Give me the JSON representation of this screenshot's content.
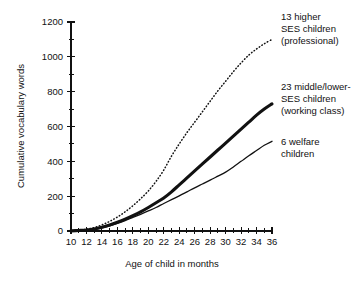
{
  "chart_data": {
    "type": "line",
    "title": "",
    "xlabel": "Age of child in months",
    "ylabel": "Cumulative vocabulary words",
    "xlim": [
      10,
      36
    ],
    "ylim": [
      0,
      1200
    ],
    "grid": false,
    "legend_position": "right-annotations",
    "x_tick_labels": [
      "10",
      "12",
      "14",
      "16",
      "18",
      "20",
      "22",
      "24",
      "26",
      "28",
      "30",
      "32",
      "34",
      "36"
    ],
    "x_tick_values": [
      10,
      12,
      14,
      16,
      18,
      20,
      22,
      24,
      26,
      28,
      30,
      32,
      34,
      36
    ],
    "x_minor_tick_values": [
      11,
      13,
      15,
      17,
      19,
      21,
      23,
      25,
      27,
      29,
      31,
      33,
      35
    ],
    "y_tick_labels": [
      "0",
      "200",
      "400",
      "600",
      "800",
      "1000",
      "1200"
    ],
    "y_tick_values": [
      0,
      200,
      400,
      600,
      800,
      1000,
      1200
    ],
    "y_minor_tick_values": [
      100,
      300,
      500,
      700,
      900,
      1100
    ],
    "x": [
      10,
      11,
      12,
      13,
      14,
      15,
      16,
      17,
      18,
      19,
      20,
      21,
      22,
      23,
      24,
      25,
      26,
      27,
      28,
      29,
      30,
      31,
      32,
      33,
      34,
      35,
      36
    ],
    "series": [
      {
        "name": "13 higher SES children (professional)",
        "style": "dotted",
        "color": "#111111",
        "values": [
          2,
          5,
          10,
          20,
          35,
          55,
          80,
          110,
          145,
          185,
          230,
          285,
          350,
          430,
          500,
          565,
          625,
          685,
          745,
          805,
          860,
          915,
          965,
          1010,
          1045,
          1075,
          1100
        ],
        "annotation": {
          "lines": [
            "13 higher",
            "SES children",
            "(professional)"
          ]
        }
      },
      {
        "name": "23 middle/lower-SES children (working class)",
        "style": "thick-solid",
        "color": "#111111",
        "values": [
          1,
          3,
          6,
          12,
          22,
          35,
          50,
          68,
          88,
          110,
          135,
          162,
          190,
          225,
          265,
          305,
          345,
          385,
          425,
          465,
          505,
          545,
          585,
          625,
          665,
          700,
          730
        ],
        "annotation": {
          "lines": [
            "23 middle/lower-",
            "SES children",
            "(working class)"
          ]
        }
      },
      {
        "name": "6 welfare children",
        "style": "thin-solid",
        "color": "#111111",
        "values": [
          1,
          2,
          5,
          10,
          18,
          30,
          44,
          60,
          78,
          96,
          115,
          135,
          158,
          180,
          202,
          225,
          248,
          270,
          292,
          315,
          338,
          368,
          400,
          432,
          462,
          492,
          515
        ],
        "annotation": {
          "lines": [
            "6 welfare",
            "children"
          ]
        }
      }
    ]
  },
  "annotations": {
    "professional": {
      "line1": "13 higher",
      "line2": "SES children",
      "line3": "(professional)"
    },
    "working_class": {
      "line1": "23 middle/lower-",
      "line2": "SES children",
      "line3": "(working class)"
    },
    "welfare": {
      "line1": "6 welfare",
      "line2": "children"
    }
  },
  "axes": {
    "x_title": "Age of child in months",
    "y_title": "Cumulative vocabulary words"
  },
  "y_ticks": {
    "t0": "0",
    "t200": "200",
    "t400": "400",
    "t600": "600",
    "t800": "800",
    "t1000": "1000",
    "t1200": "1200"
  },
  "x_ticks": {
    "t10": "10",
    "t12": "12",
    "t14": "14",
    "t16": "16",
    "t18": "18",
    "t20": "20",
    "t22": "22",
    "t24": "24",
    "t26": "26",
    "t28": "28",
    "t30": "30",
    "t32": "32",
    "t34": "34",
    "t36": "36"
  }
}
